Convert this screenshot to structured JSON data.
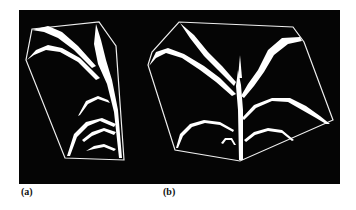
{
  "figure": {
    "background": "#050505",
    "foreground": "#ffffff",
    "subfigures": [
      {
        "label": "(a)",
        "description": "Plant wireframe hull - side view"
      },
      {
        "label": "(b)",
        "description": "Plant wireframe hull - front view"
      }
    ]
  }
}
